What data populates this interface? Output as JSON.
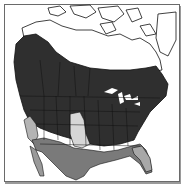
{
  "map": {
    "type": "range-map",
    "region": "North America",
    "colors": {
      "background": "#ffffff",
      "frame": "#6a6a6a",
      "primary_range": "#2f2f2f",
      "secondary_range": "#7a7a7a",
      "tertiary_range": "#b4b4b4",
      "light_range": "#d6d6d6",
      "outline": "#111111",
      "unshaded": "#ffffff"
    },
    "zones": [
      {
        "name": "primary-range",
        "shade": "dark",
        "area": "southern Canada and northern/central United States"
      },
      {
        "name": "secondary-range",
        "shade": "medium",
        "area": "southern United States and Mexico"
      },
      {
        "name": "tertiary-range",
        "shade": "light",
        "area": "interior west and southern plains"
      },
      {
        "name": "unshaded",
        "shade": "white",
        "area": "Arctic Canada, Greenland, Great Lakes"
      }
    ]
  }
}
